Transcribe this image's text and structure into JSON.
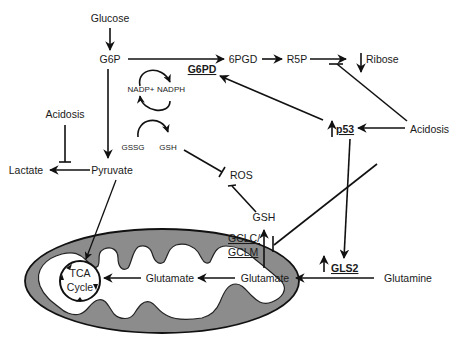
{
  "diagram": {
    "title": "",
    "colors": {
      "line": "#111111",
      "mito_fill": "#8c8c8c",
      "mito_inner": "#ffffff",
      "text": "#1a1a1a"
    },
    "nodes": {
      "glucose": "Glucose",
      "g6p": "G6P",
      "g6pd": "G6PD",
      "sixpgd": "6PGD",
      "r5p": "R5P",
      "ribose": "Ribose",
      "nadp_plus": "NADP+",
      "nadph": "NADPH",
      "gssg": "GSSG",
      "gsh_cycle": "GSH",
      "acidosis_left": "Acidosis",
      "lactate": "Lactate",
      "pyruvate": "Pyruvate",
      "ros": "ROS",
      "p53": "p53",
      "acidosis_right": "Acidosis",
      "gsh": "GSH",
      "gclc": "GCLC/",
      "gclm": "GCLM",
      "glutamate_outer": "Glutamate",
      "gls2": "GLS2",
      "glutamine": "Glutamine",
      "glutamate_inner": "Glutamate",
      "tca_line1": "TCA",
      "tca_line2": "Cycle"
    },
    "edges": [
      {
        "from": "Glucose",
        "to": "G6P",
        "type": "activation"
      },
      {
        "from": "G6P",
        "to": "6PGD",
        "type": "activation",
        "enzyme": "G6PD"
      },
      {
        "from": "6PGD",
        "to": "R5P",
        "type": "activation"
      },
      {
        "from": "R5P",
        "to": "Ribose",
        "type": "activation"
      },
      {
        "from": "G6P",
        "to": "Pyruvate",
        "type": "activation"
      },
      {
        "from": "NADP+",
        "to": "NADPH",
        "type": "cycle"
      },
      {
        "from": "GSSG",
        "to": "GSH",
        "type": "cycle"
      },
      {
        "from": "Pyruvate",
        "to": "Lactate",
        "type": "activation"
      },
      {
        "from": "Acidosis",
        "to": "Lactate production",
        "type": "inhibition"
      },
      {
        "from": "GSH",
        "to": "ROS",
        "type": "inhibition"
      },
      {
        "from": "Acidosis",
        "to": "p53",
        "type": "activation"
      },
      {
        "from": "Acidosis",
        "to": "R5P to Ribose",
        "type": "inhibition"
      },
      {
        "from": "Acidosis",
        "to": "Glutamate to GSH",
        "type": "inhibition"
      },
      {
        "from": "p53",
        "to": "G6PD",
        "type": "activation"
      },
      {
        "from": "p53",
        "to": "GLS2",
        "type": "activation"
      },
      {
        "from": "Glutamine",
        "to": "Glutamate",
        "type": "activation",
        "enzyme": "GLS2"
      },
      {
        "from": "Glutamate",
        "to": "GSH",
        "type": "activation",
        "enzyme": "GCLC/GCLM"
      },
      {
        "from": "Glutamate",
        "to": "Glutamate (mitochondria)",
        "type": "activation"
      },
      {
        "from": "Glutamate (mitochondria)",
        "to": "TCA Cycle",
        "type": "activation"
      },
      {
        "from": "Pyruvate",
        "to": "TCA Cycle",
        "type": "activation"
      }
    ],
    "indicators": {
      "ribose": "down",
      "p53": "up",
      "gls2": "up"
    }
  }
}
